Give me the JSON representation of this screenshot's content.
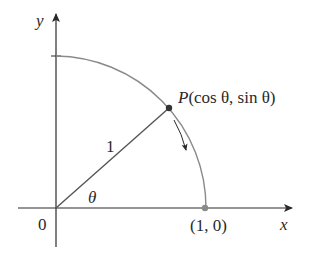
{
  "diagram": {
    "type": "unit-circle-quadrant",
    "colors": {
      "axis": "#2a2a2a",
      "arc": "#8a8a8a",
      "radius": "#555555",
      "point": "#333333",
      "point_end": "#8a8a8a",
      "text": "#2a2a2a"
    },
    "labels": {
      "y_axis": "y",
      "x_axis": "x",
      "origin": "0",
      "radius": "1",
      "angle": "θ",
      "point_p_name": "P",
      "point_p_coords": "(cos θ, sin θ)",
      "point_end": "(1, 0)"
    }
  }
}
